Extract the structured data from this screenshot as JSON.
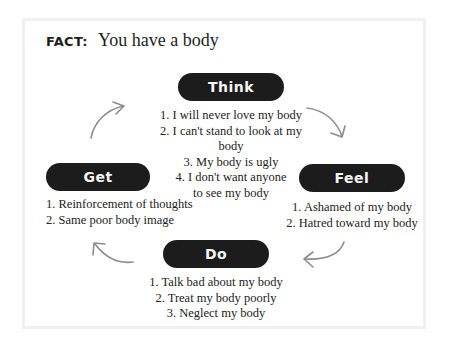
{
  "fact": {
    "label": "FACT:",
    "text": "You have a body"
  },
  "cycle": {
    "think": {
      "label": "Think",
      "items": [
        "1. I will never love my body",
        "2. I can't stand to look at my body",
        "3. My body is ugly",
        "4. I don't want anyone",
        "to see my body"
      ]
    },
    "feel": {
      "label": "Feel",
      "items": [
        "1. Ashamed of my body",
        "2. Hatred toward my body"
      ]
    },
    "do": {
      "label": "Do",
      "items": [
        "1. Talk bad about my body",
        "2. Treat my body poorly",
        "3. Neglect my body"
      ]
    },
    "get": {
      "label": "Get",
      "items": [
        "1. Reinforcement of thoughts",
        "2. Same poor body image"
      ]
    },
    "arrows": [
      "think-to-feel",
      "feel-to-do",
      "do-to-get",
      "get-to-think"
    ]
  },
  "colors": {
    "pill_bg": "#1c1c1c",
    "pill_text": "#f5f5f5",
    "arrow": "#8c8c8c",
    "card_border": "#f1f1f1"
  }
}
